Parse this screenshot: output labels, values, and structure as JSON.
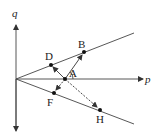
{
  "diagram": {
    "axes": {
      "horizontal_label": "p",
      "vertical_label": "q"
    },
    "points": {
      "A": {
        "label": "A"
      },
      "B": {
        "label": "B"
      },
      "D": {
        "label": "D"
      },
      "F": {
        "label": "F"
      },
      "H": {
        "label": "H"
      }
    },
    "colors": {
      "stroke": "#333333",
      "background": "#ffffff"
    }
  }
}
